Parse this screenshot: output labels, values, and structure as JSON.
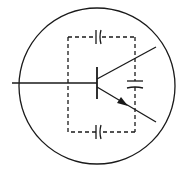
{
  "diagram": {
    "type": "schematic-symbol",
    "colors": {
      "stroke": "#1a1a1a",
      "background": "#ffffff"
    },
    "components": [
      {
        "id": "envelope",
        "kind": "circle"
      },
      {
        "id": "transistor",
        "kind": "npn-bjt",
        "terminals": [
          "base",
          "collector",
          "emitter"
        ]
      },
      {
        "id": "c-top",
        "kind": "capacitor",
        "between": [
          "base",
          "collector"
        ]
      },
      {
        "id": "c-right",
        "kind": "capacitor",
        "between": [
          "collector",
          "emitter"
        ]
      },
      {
        "id": "c-bottom",
        "kind": "capacitor",
        "between": [
          "base",
          "emitter"
        ]
      }
    ]
  }
}
